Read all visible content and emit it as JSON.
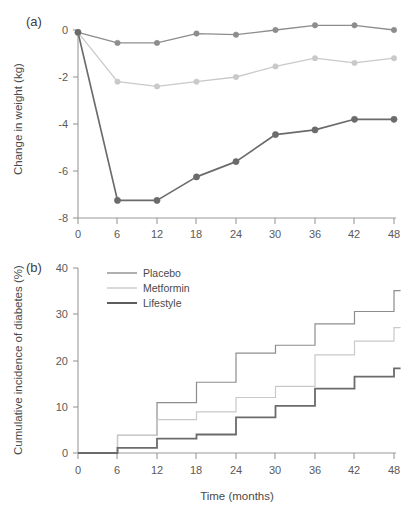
{
  "figure": {
    "panels": [
      {
        "key": "a",
        "label": "(a)"
      },
      {
        "key": "b",
        "label": "(b)"
      }
    ]
  },
  "colors": {
    "placebo": "#8d8d8d",
    "metformin": "#c9c9c9",
    "lifestyle": "#6b6b6b",
    "axis": "#9a9a9a",
    "text": "#4a4a4a"
  },
  "legend": {
    "position": "top-left-inside-panel-b",
    "entries": [
      {
        "label": "Placebo",
        "color": "#8d8d8d"
      },
      {
        "label": "Metformin",
        "color": "#c9c9c9"
      },
      {
        "label": "Lifestyle",
        "color": "#555555"
      }
    ]
  },
  "chart_data": [
    {
      "panel": "a",
      "type": "line",
      "title": "(a)",
      "xlabel": "",
      "ylabel": "Change in weight (kg)",
      "x": [
        0,
        6,
        12,
        18,
        24,
        30,
        36,
        42,
        48
      ],
      "xticks": [
        "0",
        "6",
        "12",
        "18",
        "24",
        "30",
        "36",
        "42",
        "48"
      ],
      "yticks": [
        "0",
        "-2",
        "-4",
        "-6",
        "-8"
      ],
      "xlim": [
        0,
        48
      ],
      "ylim": [
        -8,
        0
      ],
      "grid": false,
      "markers": true,
      "series": [
        {
          "name": "Placebo",
          "color": "#8d8d8d",
          "values": [
            -0.1,
            -0.55,
            -0.55,
            -0.15,
            -0.2,
            0.0,
            0.2,
            0.2,
            0.0
          ]
        },
        {
          "name": "Metformin",
          "color": "#c9c9c9",
          "values": [
            -0.1,
            -2.2,
            -2.4,
            -2.2,
            -2.0,
            -1.55,
            -1.2,
            -1.4,
            -1.2
          ]
        },
        {
          "name": "Lifestyle",
          "color": "#6b6b6b",
          "values": [
            -0.1,
            -7.25,
            -7.25,
            -6.25,
            -5.6,
            -4.45,
            -4.25,
            -3.8,
            -3.8
          ]
        }
      ]
    },
    {
      "panel": "b",
      "type": "line",
      "subtype": "step",
      "title": "(b)",
      "xlabel": "Time (months)",
      "ylabel": "Cumulative incidence of diabetes (%)",
      "x": [
        0,
        6,
        12,
        18,
        24,
        30,
        36,
        42,
        48
      ],
      "xticks": [
        "0",
        "6",
        "12",
        "18",
        "24",
        "30",
        "36",
        "42",
        "48"
      ],
      "yticks": [
        "0",
        "10",
        "20",
        "30",
        "40"
      ],
      "xlim": [
        0,
        49
      ],
      "ylim": [
        0,
        40
      ],
      "grid": false,
      "markers": false,
      "step_edges": [
        6,
        12,
        18,
        24,
        30,
        36,
        42,
        48,
        49
      ],
      "series": [
        {
          "name": "Placebo",
          "color": "#8d8d8d",
          "values": [
            3.8,
            10.9,
            15.3,
            21.6,
            23.3,
            27.9,
            30.6,
            35.1
          ]
        },
        {
          "name": "Metformin",
          "color": "#c9c9c9",
          "values": [
            3.8,
            7.2,
            8.9,
            12.0,
            14.4,
            21.2,
            24.2,
            27.1
          ]
        },
        {
          "name": "Lifestyle",
          "color": "#6b6b6b",
          "values": [
            1.1,
            3.1,
            4.0,
            7.7,
            10.2,
            13.9,
            16.5,
            18.3
          ]
        }
      ]
    }
  ]
}
